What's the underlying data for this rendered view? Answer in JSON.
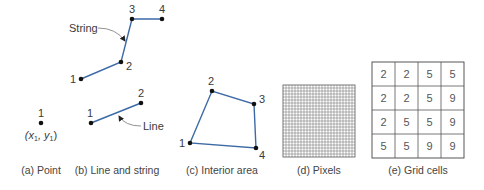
{
  "panels": {
    "point": {
      "caption": "(a) Point",
      "vertex_label": "1",
      "coord_label_x": "(x",
      "coord_sub_1": "1",
      "coord_sep": ", y",
      "coord_sub_2": "1",
      "coord_close": ")",
      "point": [
        41,
        123
      ]
    },
    "line_and_string": {
      "caption": "(b) Line and string",
      "string_label": "String",
      "line_label": "Line",
      "string_points": [
        [
          81,
          79
        ],
        [
          121,
          62
        ],
        [
          132,
          19
        ],
        [
          162,
          19
        ]
      ],
      "string_vertex_labels": [
        "1",
        "2",
        "3",
        "4"
      ],
      "line_points": [
        [
          91,
          123
        ],
        [
          141,
          103
        ]
      ],
      "line_vertex_labels": [
        "1",
        "2"
      ]
    },
    "interior_area": {
      "caption": "(c) Interior area",
      "polygon_points": [
        [
          190,
          143
        ],
        [
          212,
          91
        ],
        [
          254,
          104
        ],
        [
          256,
          148
        ]
      ],
      "vertex_labels": [
        "1",
        "2",
        "3",
        "4"
      ]
    },
    "pixels": {
      "caption": "(d) Pixels",
      "grid_rows": 24,
      "grid_cols": 24
    },
    "grid_cells": {
      "caption": "(e) Grid cells",
      "values": [
        [
          "2",
          "2",
          "5",
          "5"
        ],
        [
          "2",
          "2",
          "5",
          "9"
        ],
        [
          "2",
          "5",
          "5",
          "9"
        ],
        [
          "5",
          "5",
          "9",
          "9"
        ]
      ]
    }
  },
  "colors": {
    "geometry_stroke": "#3d6aa6",
    "vertex_fill": "#111111",
    "text": "#3a3a3a"
  }
}
